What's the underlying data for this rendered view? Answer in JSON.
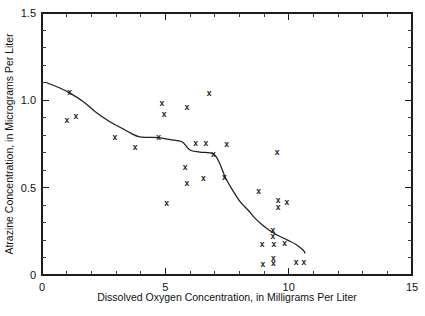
{
  "chart_data": {
    "type": "scatter",
    "title": "",
    "xlabel": "Dissolved Oxygen Concentration, in Milligrams Per Liter",
    "ylabel": "Atrazine Concentration, in Micrograms Per Liter",
    "xlim": [
      0,
      15
    ],
    "ylim": [
      0,
      1.5
    ],
    "xticks": [
      0,
      5,
      10,
      15
    ],
    "xticklabels": [
      "0",
      "5",
      "10",
      "15"
    ],
    "yticks": [
      0,
      0.5,
      1.0,
      1.5
    ],
    "yticklabels": [
      "0",
      "0.5",
      "1.0",
      "1.5"
    ],
    "x_minor_tick_step": 1,
    "y_minor_tick_step": 0.1,
    "grid": false,
    "legend": false,
    "marker_symbol": "x",
    "marker_color": "#1a1a1a",
    "line_color": "#1f1f1f",
    "frame_color": "#1d1d1d",
    "background_color": "#ffffff",
    "series": [
      {
        "name": "Observations",
        "type": "scatter",
        "points": [
          [
            1.01,
            0.885
          ],
          [
            1.12,
            1.05
          ],
          [
            1.37,
            0.91
          ],
          [
            2.95,
            0.792
          ],
          [
            3.77,
            0.73
          ],
          [
            4.73,
            0.788
          ],
          [
            4.86,
            0.983
          ],
          [
            4.95,
            0.921
          ],
          [
            5.05,
            0.41
          ],
          [
            5.8,
            0.617
          ],
          [
            5.87,
            0.96
          ],
          [
            5.87,
            0.528
          ],
          [
            6.23,
            0.754
          ],
          [
            6.54,
            0.554
          ],
          [
            6.64,
            0.754
          ],
          [
            6.77,
            1.044
          ],
          [
            6.95,
            0.693
          ],
          [
            7.39,
            0.563
          ],
          [
            7.48,
            0.748
          ],
          [
            8.78,
            0.482
          ],
          [
            8.92,
            0.175
          ],
          [
            8.95,
            0.065
          ],
          [
            9.36,
            0.258
          ],
          [
            9.36,
            0.225
          ],
          [
            9.38,
            0.096
          ],
          [
            9.38,
            0.07
          ],
          [
            9.4,
            0.175
          ],
          [
            9.53,
            0.702
          ],
          [
            9.57,
            0.429
          ],
          [
            9.57,
            0.391
          ],
          [
            9.84,
            0.181
          ],
          [
            9.93,
            0.42
          ],
          [
            10.3,
            0.076
          ],
          [
            10.62,
            0.073
          ]
        ]
      },
      {
        "name": "LOWESS smooth",
        "type": "line",
        "points": [
          [
            0.16,
            1.102
          ],
          [
            0.7,
            1.072
          ],
          [
            1.15,
            1.04
          ],
          [
            1.65,
            0.995
          ],
          [
            2.16,
            0.935
          ],
          [
            2.7,
            0.882
          ],
          [
            3.24,
            0.84
          ],
          [
            3.6,
            0.812
          ],
          [
            3.92,
            0.792
          ],
          [
            4.3,
            0.788
          ],
          [
            4.73,
            0.786
          ],
          [
            5.2,
            0.775
          ],
          [
            5.67,
            0.763
          ],
          [
            6.0,
            0.716
          ],
          [
            6.4,
            0.704
          ],
          [
            6.95,
            0.693
          ],
          [
            7.2,
            0.64
          ],
          [
            7.42,
            0.563
          ],
          [
            7.7,
            0.492
          ],
          [
            8.03,
            0.42
          ],
          [
            8.35,
            0.372
          ],
          [
            8.64,
            0.324
          ],
          [
            8.95,
            0.285
          ],
          [
            9.2,
            0.258
          ],
          [
            9.55,
            0.228
          ],
          [
            9.95,
            0.2
          ],
          [
            10.3,
            0.175
          ],
          [
            10.6,
            0.14
          ],
          [
            10.66,
            0.126
          ]
        ]
      }
    ]
  }
}
